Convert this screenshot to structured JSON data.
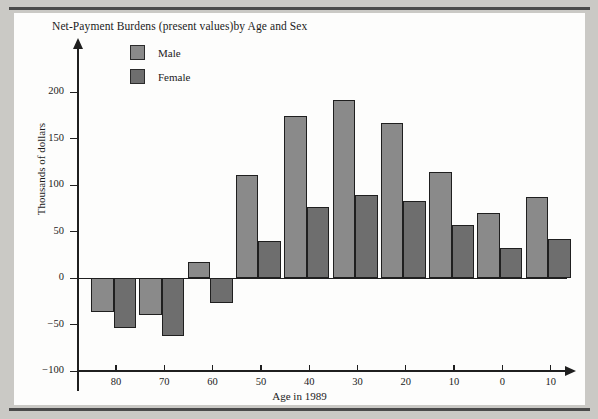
{
  "chart_data": {
    "type": "bar",
    "title": "Net-Payment Burdens (present values)by Age and Sex",
    "xlabel": "Age in 1989",
    "ylabel": "Thousands of dollars",
    "ylim": [
      -100,
      215
    ],
    "yticks": [
      200,
      150,
      100,
      50,
      0,
      -50,
      -100
    ],
    "ytick_labels": [
      "200",
      "150",
      "100",
      "50",
      "0",
      "−50",
      "−100"
    ],
    "xticks": [
      80,
      70,
      60,
      50,
      40,
      30,
      20,
      10,
      0,
      10
    ],
    "xtick_labels": [
      "80",
      "70",
      "60",
      "50",
      "40",
      "30",
      "20",
      "10",
      "0",
      "10"
    ],
    "grid": false,
    "legend_position": "top-left",
    "categories": [
      "85",
      "75",
      "65",
      "55",
      "45",
      "35",
      "25",
      "15",
      "5",
      "0"
    ],
    "series": [
      {
        "name": "Male",
        "color": "#8a8a8a",
        "values": [
          -36,
          -40,
          17,
          111,
          174,
          192,
          167,
          114,
          70,
          87
        ]
      },
      {
        "name": "Female",
        "color": "#6e6e6e",
        "values": [
          -53,
          -62,
          -27,
          40,
          77,
          90,
          83,
          57,
          33,
          42
        ]
      }
    ],
    "bars": [
      {
        "series": "Male",
        "category": "85",
        "value": -36
      },
      {
        "series": "Female",
        "category": "85",
        "value": -53
      },
      {
        "series": "Male",
        "category": "75",
        "value": -40
      },
      {
        "series": "Female",
        "category": "75",
        "value": -62
      },
      {
        "series": "Male",
        "category": "65",
        "value": 17
      },
      {
        "series": "Female",
        "category": "65",
        "value": -27
      },
      {
        "series": "Male",
        "category": "55",
        "value": 111
      },
      {
        "series": "Female",
        "category": "55",
        "value": 40
      },
      {
        "series": "Male",
        "category": "45",
        "value": 174
      },
      {
        "series": "Female",
        "category": "45",
        "value": 77
      },
      {
        "series": "Male",
        "category": "35",
        "value": 192
      },
      {
        "series": "Female",
        "category": "35",
        "value": 90
      },
      {
        "series": "Male",
        "category": "25",
        "value": 167
      },
      {
        "series": "Female",
        "category": "25",
        "value": 83
      },
      {
        "series": "Male",
        "category": "15",
        "value": 114
      },
      {
        "series": "Female",
        "category": "15",
        "value": 57
      },
      {
        "series": "Male",
        "category": "5",
        "value": 70
      },
      {
        "series": "Female",
        "category": "5",
        "value": 33
      },
      {
        "series": "Male",
        "category": "0",
        "value": 87
      },
      {
        "series": "Female",
        "category": "0",
        "value": 42
      }
    ]
  },
  "legend": {
    "items": [
      {
        "label": "Male",
        "color": "#8a8a8a"
      },
      {
        "label": "Female",
        "color": "#6e6e6e"
      }
    ]
  },
  "colors": {
    "male": "#8a8a8a",
    "female": "#6e6e6e",
    "axis": "#1f1f1f",
    "page_background": "#cac9c5",
    "paper": "#fdfdfc",
    "rule": "#4a4a4a"
  }
}
